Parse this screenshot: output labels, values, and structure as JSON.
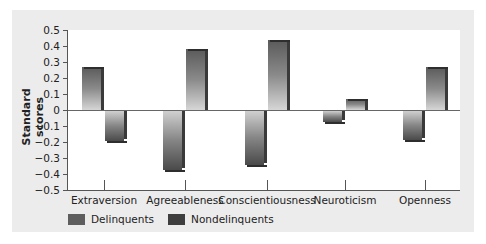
{
  "chart_data": {
    "type": "bar",
    "title": "",
    "xlabel": "",
    "ylabel": "Standard scores",
    "ylim": [
      -0.5,
      0.5
    ],
    "yticks": [
      "0.5",
      "0.4",
      "0.3",
      "0.2",
      "0.1",
      "0",
      "−0.1",
      "−0.2",
      "−0.3",
      "−0.4",
      "−0.5"
    ],
    "categories": [
      "Extraversion",
      "Agreeableness",
      "Conscientiousness",
      "Neuroticism",
      "Openness"
    ],
    "series": [
      {
        "name": "Delinquents",
        "values": [
          0.27,
          -0.37,
          -0.34,
          -0.07,
          -0.18
        ],
        "color": "#5e5e5e"
      },
      {
        "name": "Nondelinquents",
        "values": [
          -0.19,
          0.38,
          0.44,
          0.07,
          0.27
        ],
        "color": "#3e3e3e"
      }
    ],
    "grid": false,
    "legend_position": "bottom-left"
  },
  "axis": {
    "y_title": "Standard scores"
  },
  "legend": {
    "items": [
      {
        "label": "Delinquents",
        "color": "#5e5e5e"
      },
      {
        "label": "Nondelinquents",
        "color": "#3e3e3e"
      }
    ]
  }
}
